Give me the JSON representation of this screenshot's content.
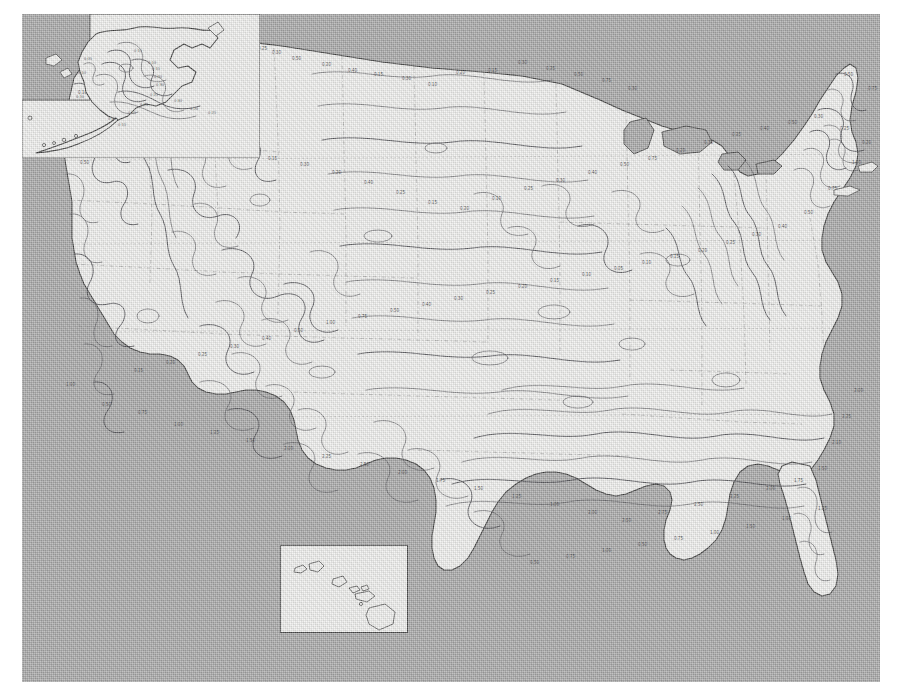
{
  "document": {
    "kind": "scanned-contour-map",
    "region": "United States",
    "background_color": "#a9a9a9",
    "land_color": "#f1f1ef",
    "line_color": "#3c3c3c"
  },
  "map": {
    "main_title": "",
    "panels": [
      {
        "id": "conus",
        "label": "Contiguous United States"
      },
      {
        "id": "alaska",
        "label": "Alaska"
      },
      {
        "id": "hawaii",
        "label": "Hawaii"
      }
    ]
  },
  "chart_data": {
    "type": "contour",
    "title": "",
    "xlabel": "",
    "ylabel": "",
    "units": "",
    "contour_interval": 0.05,
    "value_range": [
      0.05,
      2.5
    ],
    "levels": [
      0.05,
      0.1,
      0.15,
      0.2,
      0.25,
      0.3,
      0.4,
      0.5,
      0.75,
      1.0,
      1.25,
      1.5,
      1.75,
      2.0,
      2.25,
      2.5
    ],
    "legend": [],
    "grid": true
  },
  "labels": {
    "conus": [
      {
        "t": "0.05",
        "x": 86,
        "y": 18
      },
      {
        "t": "0.10",
        "x": 112,
        "y": 22
      },
      {
        "t": "0.15",
        "x": 128,
        "y": 26
      },
      {
        "t": "0.20",
        "x": 142,
        "y": 30
      },
      {
        "t": "0.25",
        "x": 158,
        "y": 34
      },
      {
        "t": "0.30",
        "x": 174,
        "y": 30
      },
      {
        "t": "0.10",
        "x": 196,
        "y": 30
      },
      {
        "t": "0.15",
        "x": 208,
        "y": 34
      },
      {
        "t": "0.20",
        "x": 222,
        "y": 32
      },
      {
        "t": "0.25",
        "x": 236,
        "y": 36
      },
      {
        "t": "0.30",
        "x": 250,
        "y": 40
      },
      {
        "t": "0.50",
        "x": 270,
        "y": 46
      },
      {
        "t": "0.20",
        "x": 300,
        "y": 52
      },
      {
        "t": "0.40",
        "x": 326,
        "y": 58
      },
      {
        "t": "0.15",
        "x": 352,
        "y": 62
      },
      {
        "t": "0.30",
        "x": 380,
        "y": 66
      },
      {
        "t": "0.10",
        "x": 406,
        "y": 72
      },
      {
        "t": "0.20",
        "x": 434,
        "y": 60
      },
      {
        "t": "0.15",
        "x": 466,
        "y": 58
      },
      {
        "t": "0.30",
        "x": 496,
        "y": 50
      },
      {
        "t": "0.25",
        "x": 524,
        "y": 56
      },
      {
        "t": "0.50",
        "x": 552,
        "y": 62
      },
      {
        "t": "0.75",
        "x": 580,
        "y": 68
      },
      {
        "t": "0.30",
        "x": 606,
        "y": 76
      },
      {
        "t": "0.10",
        "x": 56,
        "y": 80
      },
      {
        "t": "0.05",
        "x": 42,
        "y": 110
      },
      {
        "t": "0.20",
        "x": 70,
        "y": 118
      },
      {
        "t": "0.50",
        "x": 58,
        "y": 150
      },
      {
        "t": "0.15",
        "x": 92,
        "y": 142
      },
      {
        "t": "0.30",
        "x": 120,
        "y": 128
      },
      {
        "t": "0.25",
        "x": 150,
        "y": 118
      },
      {
        "t": "0.40",
        "x": 182,
        "y": 124
      },
      {
        "t": "0.20",
        "x": 214,
        "y": 134
      },
      {
        "t": "0.15",
        "x": 246,
        "y": 146
      },
      {
        "t": "0.30",
        "x": 278,
        "y": 152
      },
      {
        "t": "0.20",
        "x": 310,
        "y": 160
      },
      {
        "t": "0.40",
        "x": 342,
        "y": 170
      },
      {
        "t": "0.25",
        "x": 374,
        "y": 180
      },
      {
        "t": "0.15",
        "x": 406,
        "y": 190
      },
      {
        "t": "0.20",
        "x": 438,
        "y": 196
      },
      {
        "t": "0.10",
        "x": 470,
        "y": 186
      },
      {
        "t": "0.25",
        "x": 502,
        "y": 176
      },
      {
        "t": "0.30",
        "x": 534,
        "y": 168
      },
      {
        "t": "0.40",
        "x": 566,
        "y": 160
      },
      {
        "t": "0.50",
        "x": 598,
        "y": 152
      },
      {
        "t": "0.75",
        "x": 626,
        "y": 146
      },
      {
        "t": "0.20",
        "x": 654,
        "y": 138
      },
      {
        "t": "0.30",
        "x": 682,
        "y": 130
      },
      {
        "t": "0.25",
        "x": 710,
        "y": 122
      },
      {
        "t": "0.40",
        "x": 738,
        "y": 116
      },
      {
        "t": "0.50",
        "x": 766,
        "y": 110
      },
      {
        "t": "0.30",
        "x": 792,
        "y": 104
      },
      {
        "t": "0.25",
        "x": 818,
        "y": 116
      },
      {
        "t": "0.20",
        "x": 840,
        "y": 130
      },
      {
        "t": "0.50",
        "x": 822,
        "y": 62
      },
      {
        "t": "0.75",
        "x": 846,
        "y": 76
      },
      {
        "t": "1.00",
        "x": 830,
        "y": 150
      },
      {
        "t": "0.75",
        "x": 806,
        "y": 176
      },
      {
        "t": "0.50",
        "x": 782,
        "y": 200
      },
      {
        "t": "0.40",
        "x": 756,
        "y": 214
      },
      {
        "t": "0.30",
        "x": 730,
        "y": 222
      },
      {
        "t": "0.25",
        "x": 704,
        "y": 230
      },
      {
        "t": "0.20",
        "x": 676,
        "y": 238
      },
      {
        "t": "0.15",
        "x": 648,
        "y": 244
      },
      {
        "t": "0.10",
        "x": 620,
        "y": 250
      },
      {
        "t": "0.05",
        "x": 592,
        "y": 256
      },
      {
        "t": "0.10",
        "x": 560,
        "y": 262
      },
      {
        "t": "0.15",
        "x": 528,
        "y": 268
      },
      {
        "t": "0.20",
        "x": 496,
        "y": 274
      },
      {
        "t": "0.25",
        "x": 464,
        "y": 280
      },
      {
        "t": "0.30",
        "x": 432,
        "y": 286
      },
      {
        "t": "0.40",
        "x": 400,
        "y": 292
      },
      {
        "t": "0.50",
        "x": 368,
        "y": 298
      },
      {
        "t": "0.75",
        "x": 336,
        "y": 304
      },
      {
        "t": "1.00",
        "x": 304,
        "y": 310
      },
      {
        "t": "0.50",
        "x": 272,
        "y": 318
      },
      {
        "t": "0.40",
        "x": 240,
        "y": 326
      },
      {
        "t": "0.30",
        "x": 208,
        "y": 334
      },
      {
        "t": "0.25",
        "x": 176,
        "y": 342
      },
      {
        "t": "0.20",
        "x": 144,
        "y": 350
      },
      {
        "t": "0.15",
        "x": 112,
        "y": 358
      },
      {
        "t": "1.00",
        "x": 44,
        "y": 372
      },
      {
        "t": "0.50",
        "x": 80,
        "y": 392
      },
      {
        "t": "0.75",
        "x": 116,
        "y": 400
      },
      {
        "t": "1.00",
        "x": 152,
        "y": 412
      },
      {
        "t": "1.25",
        "x": 188,
        "y": 420
      },
      {
        "t": "1.50",
        "x": 224,
        "y": 428
      },
      {
        "t": "2.00",
        "x": 262,
        "y": 436
      },
      {
        "t": "2.25",
        "x": 300,
        "y": 444
      },
      {
        "t": "2.50",
        "x": 338,
        "y": 452
      },
      {
        "t": "2.00",
        "x": 376,
        "y": 460
      },
      {
        "t": "1.75",
        "x": 414,
        "y": 468
      },
      {
        "t": "1.50",
        "x": 452,
        "y": 476
      },
      {
        "t": "1.25",
        "x": 490,
        "y": 484
      },
      {
        "t": "1.00",
        "x": 528,
        "y": 492
      },
      {
        "t": "2.00",
        "x": 566,
        "y": 500
      },
      {
        "t": "2.50",
        "x": 600,
        "y": 508
      },
      {
        "t": "2.75",
        "x": 636,
        "y": 500
      },
      {
        "t": "2.50",
        "x": 672,
        "y": 492
      },
      {
        "t": "2.25",
        "x": 708,
        "y": 484
      },
      {
        "t": "2.00",
        "x": 744,
        "y": 476
      },
      {
        "t": "1.75",
        "x": 772,
        "y": 468
      },
      {
        "t": "1.50",
        "x": 796,
        "y": 456
      },
      {
        "t": "2.10",
        "x": 810,
        "y": 430
      },
      {
        "t": "2.25",
        "x": 820,
        "y": 404
      },
      {
        "t": "2.00",
        "x": 832,
        "y": 378
      },
      {
        "t": "1.25",
        "x": 796,
        "y": 496
      },
      {
        "t": "1.00",
        "x": 760,
        "y": 506
      },
      {
        "t": "1.50",
        "x": 724,
        "y": 514
      },
      {
        "t": "1.00",
        "x": 688,
        "y": 520
      },
      {
        "t": "0.75",
        "x": 652,
        "y": 526
      },
      {
        "t": "0.50",
        "x": 616,
        "y": 532
      },
      {
        "t": "1.00",
        "x": 580,
        "y": 538
      },
      {
        "t": "0.75",
        "x": 544,
        "y": 544
      },
      {
        "t": "0.50",
        "x": 508,
        "y": 550
      }
    ],
    "alaska": [
      {
        "t": "0.05",
        "x": 62,
        "y": 46
      },
      {
        "t": "0.10",
        "x": 56,
        "y": 60
      },
      {
        "t": "0.15",
        "x": 112,
        "y": 38
      },
      {
        "t": "0.10",
        "x": 126,
        "y": 50
      },
      {
        "t": "0.15",
        "x": 130,
        "y": 56
      },
      {
        "t": "0.20",
        "x": 132,
        "y": 64
      },
      {
        "t": "0.30",
        "x": 134,
        "y": 72
      },
      {
        "t": "0.25",
        "x": 128,
        "y": 82
      },
      {
        "t": "0.20",
        "x": 118,
        "y": 92
      },
      {
        "t": "0.15",
        "x": 106,
        "y": 100
      },
      {
        "t": "0.10",
        "x": 86,
        "y": 106
      },
      {
        "t": "0.15",
        "x": 96,
        "y": 112
      },
      {
        "t": "0.30",
        "x": 152,
        "y": 88
      },
      {
        "t": "0.20",
        "x": 168,
        "y": 96
      },
      {
        "t": "0.25",
        "x": 186,
        "y": 100
      },
      {
        "t": "0.10",
        "x": 54,
        "y": 84
      }
    ],
    "hawaii": []
  }
}
